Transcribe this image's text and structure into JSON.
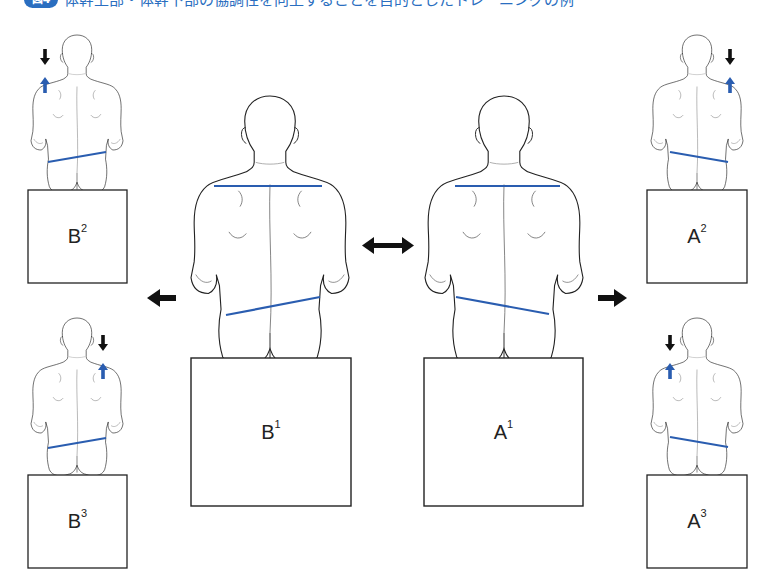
{
  "title": {
    "badge": "図4",
    "text": "体幹上部・体幹下部の協調性を向上することを目的としたトレーニングの例",
    "color": "#2a6ec0"
  },
  "colors": {
    "line_blue": "#2a5db0",
    "arrow_black": "#111111",
    "outline": "#222222"
  },
  "figures": [
    {
      "id": "B2",
      "letter": "B",
      "sup": "2",
      "position": "top-left",
      "pelvis_tilt": "left-low",
      "shoulder_arrows": "left"
    },
    {
      "id": "B3",
      "letter": "B",
      "sup": "3",
      "position": "bottom-left",
      "pelvis_tilt": "left-low",
      "shoulder_arrows": "right"
    },
    {
      "id": "B1",
      "letter": "B",
      "sup": "1",
      "position": "center-left",
      "pelvis_tilt": "left-low",
      "shoulder_line": "level"
    },
    {
      "id": "A1",
      "letter": "A",
      "sup": "1",
      "position": "center-right",
      "pelvis_tilt": "right-low",
      "shoulder_line": "level"
    },
    {
      "id": "A2",
      "letter": "A",
      "sup": "2",
      "position": "top-right",
      "pelvis_tilt": "right-low",
      "shoulder_arrows": "right"
    },
    {
      "id": "A3",
      "letter": "A",
      "sup": "3",
      "position": "bottom-right",
      "pelvis_tilt": "right-low",
      "shoulder_arrows": "left"
    }
  ],
  "arrows": [
    {
      "name": "double-arrow",
      "direction": "left-right",
      "between": [
        "B1",
        "A1"
      ]
    },
    {
      "name": "arrow-left",
      "direction": "left",
      "from": "B1",
      "to": "B2/B3"
    },
    {
      "name": "arrow-right",
      "direction": "right",
      "from": "A1",
      "to": "A2/A3"
    }
  ]
}
